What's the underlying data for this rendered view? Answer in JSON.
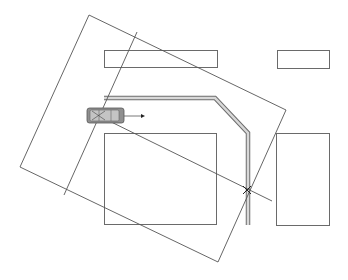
{
  "diagram": {
    "colors": {
      "line": "#555555",
      "building_stroke": "#6a6a6a",
      "wall_fill": "#d8d8d8",
      "car_fill": "#8f8f8f",
      "car_window": "#c4c4c4",
      "background": "#ffffff"
    },
    "buildings": [
      {
        "id": "top-left",
        "x": 104,
        "y": 50,
        "w": 113,
        "h": 17
      },
      {
        "id": "top-right",
        "x": 277,
        "y": 50,
        "w": 52,
        "h": 18
      },
      {
        "id": "bottom-left",
        "x": 104,
        "y": 133,
        "w": 112,
        "h": 91
      },
      {
        "id": "bottom-right",
        "x": 276,
        "y": 133,
        "w": 53,
        "h": 92
      }
    ],
    "wall_path": [
      [
        104,
        98
      ],
      [
        215,
        98
      ],
      [
        248,
        133
      ],
      [
        248,
        225
      ]
    ],
    "sensor_field": [
      [
        89,
        15
      ],
      [
        286,
        110
      ],
      [
        218,
        262
      ],
      [
        20,
        167
      ]
    ],
    "lines": [
      {
        "id": "inner-diagonal",
        "from": [
          137,
          32
        ],
        "to": [
          64,
          195
        ]
      },
      {
        "id": "projection-line",
        "from": [
          97,
          115
        ],
        "to": [
          272,
          201
        ]
      }
    ],
    "car": {
      "x": 87,
      "y": 108,
      "w": 37,
      "h": 15,
      "heading": "right"
    },
    "arrow": {
      "from": [
        124,
        116
      ],
      "to": [
        145,
        116
      ]
    },
    "intersection_point": [
      247,
      190
    ]
  }
}
